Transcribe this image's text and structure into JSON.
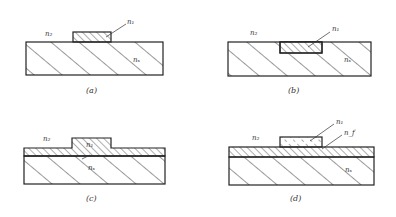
{
  "figure": {
    "panels": [
      {
        "id": "a",
        "caption": "(a)",
        "labels": {
          "cover": "n₂",
          "guide": "n₁",
          "substrate": "nₛ"
        },
        "type": "ridge-on-substrate"
      },
      {
        "id": "b",
        "caption": "(b)",
        "labels": {
          "cover": "n₂",
          "guide": "n₁",
          "substrate": "nₛ"
        },
        "type": "embedded-channel"
      },
      {
        "id": "c",
        "caption": "(c)",
        "labels": {
          "cover": "n₂",
          "guide": "n₁",
          "substrate": "nₛ"
        },
        "type": "rib-waveguide"
      },
      {
        "id": "d",
        "caption": "(d)",
        "labels": {
          "cover": "n₂",
          "strip": "n₁",
          "film": "n_f",
          "substrate": "nₛ"
        },
        "type": "strip-loaded"
      }
    ]
  }
}
